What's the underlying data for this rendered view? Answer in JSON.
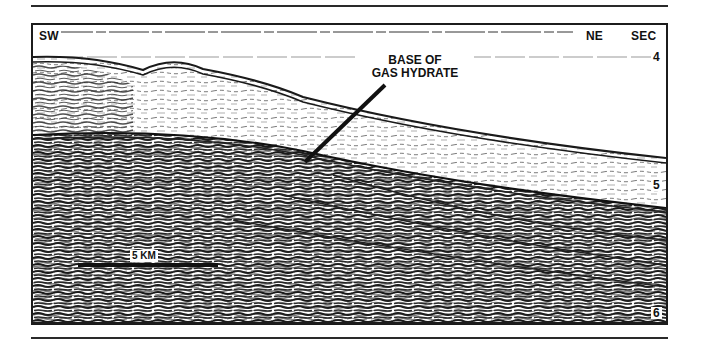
{
  "figure": {
    "type": "seismic reflection profile",
    "labels": {
      "left_direction": "SW",
      "right_direction": "NE",
      "axis_unit": "SEC"
    },
    "time_ticks": [
      {
        "label": "4",
        "y": 32
      },
      {
        "label": "5",
        "y": 160
      },
      {
        "label": "6",
        "y": 287
      }
    ],
    "annotation": {
      "line1": "BASE OF",
      "line2": "GAS HYDRATE"
    },
    "scale_bar": {
      "label": "5 KM"
    },
    "colors": {
      "ink": "#111111",
      "paper": "#ffffff",
      "reflector": "#2b2b2b"
    }
  }
}
